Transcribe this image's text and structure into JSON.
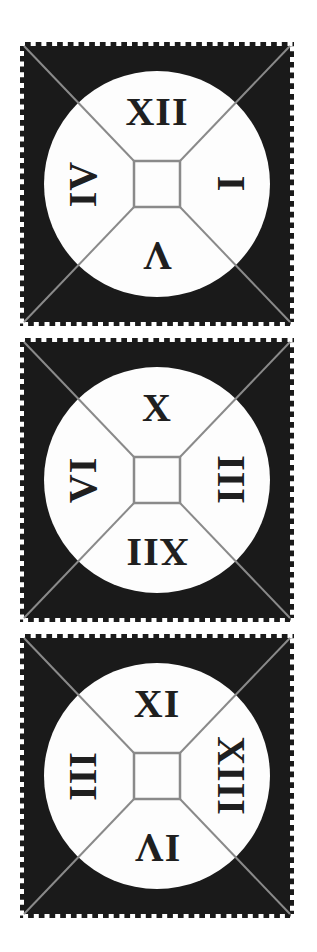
{
  "page": {
    "kind": "puzzle-figure"
  },
  "colors": {
    "background": "#ffffff",
    "stamp_black": "#1a1a1a",
    "line_gray": "#8a8a8a",
    "face_white": "#fdfdfd",
    "numeral_ink": "#1f1f1f"
  },
  "panels": [
    {
      "name": "stamp-1",
      "numerals": {
        "top": {
          "text": "XII",
          "rotation_deg": 0
        },
        "right": {
          "text": "I",
          "rotation_deg": 90
        },
        "bottom": {
          "text": "V",
          "rotation_deg": 180
        },
        "left": {
          "text": "IV",
          "rotation_deg": -90
        }
      }
    },
    {
      "name": "stamp-2",
      "numerals": {
        "top": {
          "text": "X",
          "rotation_deg": 0
        },
        "right": {
          "text": "III",
          "rotation_deg": 90
        },
        "bottom": {
          "text": "XII",
          "rotation_deg": 180
        },
        "left": {
          "text": "VI",
          "rotation_deg": -90
        }
      }
    },
    {
      "name": "stamp-3",
      "numerals": {
        "top": {
          "text": "XI",
          "rotation_deg": 0
        },
        "right": {
          "text": "XIII",
          "rotation_deg": 90
        },
        "bottom": {
          "text": "IV",
          "rotation_deg": 180
        },
        "left": {
          "text": "III",
          "rotation_deg": -90
        }
      }
    }
  ]
}
